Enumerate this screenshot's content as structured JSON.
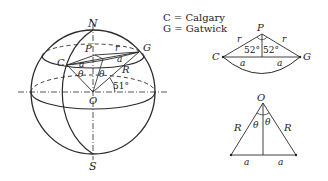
{
  "legend": {
    "c_line": "C = Calgary",
    "g_line": "G = Gatwick"
  },
  "sphere": {
    "north_label": "N",
    "south_label": "S",
    "center_label": "O",
    "pole_label": "P",
    "calgary_label": "C",
    "gatwick_label": "G",
    "small_radius_label": "r",
    "half_chord_label_left": "a",
    "half_chord_label_right": "a",
    "theta_left": "θ",
    "theta_right": "θ",
    "radius_label": "R",
    "latitude_angle": "51°"
  },
  "latitude_triangle": {
    "apex_label": "P",
    "left_label": "C",
    "right_label": "G",
    "side_left": "r",
    "side_right": "r",
    "angle_left": "52°",
    "angle_right": "52°",
    "base_left": "a",
    "base_right": "a"
  },
  "center_triangle": {
    "apex_label": "O",
    "side_left": "R",
    "side_right": "R",
    "theta_left": "θ",
    "theta_right": "θ",
    "base_left": "a",
    "base_right": "a"
  }
}
